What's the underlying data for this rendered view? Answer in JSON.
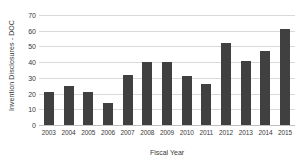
{
  "chart_data": {
    "type": "bar",
    "title": "",
    "xlabel": "Fiscal Year",
    "ylabel": "Invention Disclosures - DOC",
    "categories": [
      "2003",
      "2004",
      "2005",
      "2006",
      "2007",
      "2008",
      "2009",
      "2010",
      "2011",
      "2012",
      "2013",
      "2014",
      "2015"
    ],
    "values": [
      21,
      25,
      21,
      14,
      32,
      40,
      40,
      31,
      26,
      52,
      41,
      47,
      61
    ],
    "ylim": [
      0,
      70
    ],
    "ytick_labels": [
      "0",
      "10",
      "20",
      "30",
      "40",
      "50",
      "60",
      "70"
    ],
    "ytick_values": [
      0,
      10,
      20,
      30,
      40,
      50,
      60,
      70
    ],
    "grid": true,
    "legend": false,
    "bar_color": "#404040",
    "grid_color": "#d9d9d9",
    "text_color": "#3a3a3a"
  }
}
